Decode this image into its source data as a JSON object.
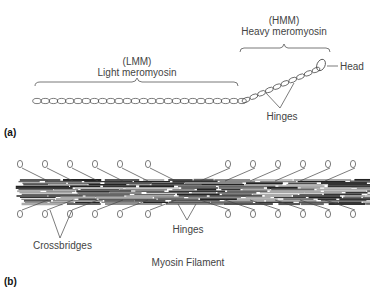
{
  "figure": {
    "panel_a": {
      "part_label": "(a)",
      "lmm": {
        "abbr": "(LMM)",
        "name": "Light meromyosin"
      },
      "hmm": {
        "abbr": "(HMM)",
        "name": "Heavy meromyosin"
      },
      "head_label": "Head",
      "hinges_label": "Hinges"
    },
    "panel_b": {
      "part_label": "(b)",
      "crossbridges_label": "Crossbridges",
      "hinges_label": "Hinges",
      "caption": "Myosin Filament"
    }
  }
}
